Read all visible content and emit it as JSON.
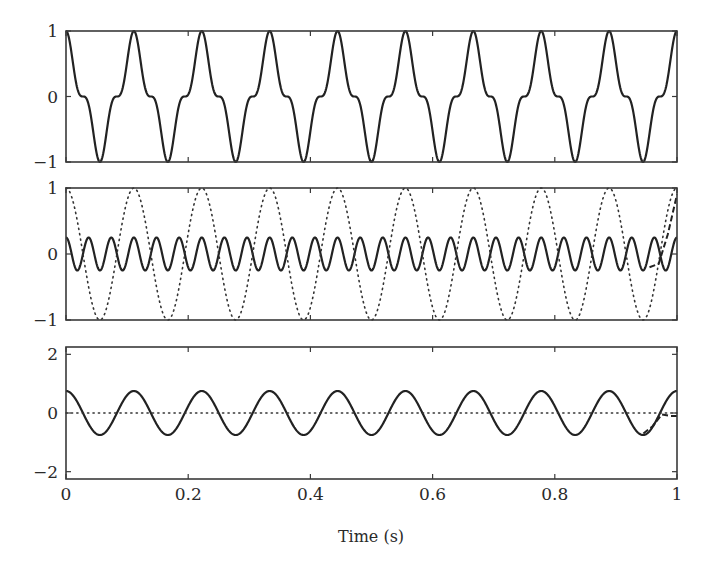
{
  "chart_data": [
    {
      "type": "line",
      "panel": "top",
      "title": "",
      "xlabel": "",
      "ylabel": "",
      "xlim": [
        0,
        1
      ],
      "ylim": [
        -1,
        1
      ],
      "yticks": [
        -1,
        0,
        1
      ],
      "ytick_labels": [
        "−1",
        "0",
        "1"
      ],
      "xticks": [
        0,
        0.2,
        0.4,
        0.6,
        0.8,
        1
      ],
      "grid": false,
      "series": [
        {
          "name": "signal",
          "style": "solid",
          "description": "cos^3(2π·9t) = 0.75cos(2π·9t)+0.25cos(2π·27t)",
          "frequency_hz": 9,
          "amplitude": 1,
          "formula": "cos3"
        }
      ]
    },
    {
      "type": "line",
      "panel": "middle",
      "title": "",
      "xlabel": "",
      "ylabel": "",
      "xlim": [
        0,
        1
      ],
      "ylim": [
        -1,
        1
      ],
      "yticks": [
        -1,
        0,
        1
      ],
      "ytick_labels": [
        "−1",
        "0",
        "1"
      ],
      "xticks": [
        0,
        0.2,
        0.4,
        0.6,
        0.8,
        1
      ],
      "grid": false,
      "series": [
        {
          "name": "third harmonic",
          "style": "solid",
          "frequency_hz": 27,
          "amplitude": 0.25,
          "formula": "cos"
        },
        {
          "name": "reference",
          "style": "dotted",
          "frequency_hz": 9,
          "amplitude": 1,
          "formula": "cos"
        },
        {
          "name": "estimate (edge deviation)",
          "style": "dashed",
          "x": [
            0.955,
            0.97,
            0.985,
            1.0
          ],
          "y": [
            -0.2,
            -0.15,
            0.3,
            0.9
          ]
        }
      ]
    },
    {
      "type": "line",
      "panel": "bottom",
      "title": "",
      "xlabel": "Time (s)",
      "ylabel": "",
      "xlim": [
        0,
        1
      ],
      "ylim": [
        -2.25,
        2.25
      ],
      "yticks": [
        -2,
        0,
        2
      ],
      "ytick_labels": [
        "−2",
        "0",
        "2"
      ],
      "xticks": [
        0,
        0.2,
        0.4,
        0.6,
        0.8,
        1
      ],
      "xtick_labels": [
        "0",
        "0.2",
        "0.4",
        "0.6",
        "0.8",
        "1"
      ],
      "grid": false,
      "series": [
        {
          "name": "fundamental",
          "style": "solid",
          "frequency_hz": 9,
          "amplitude": 0.75,
          "formula": "cos"
        },
        {
          "name": "zero reference",
          "style": "dotted",
          "frequency_hz": 0,
          "amplitude": 0,
          "formula": "const"
        },
        {
          "name": "estimate (edge deviation)",
          "style": "dashed",
          "x": [
            0.945,
            0.96,
            0.975,
            0.99,
            1.0
          ],
          "y": [
            -0.7,
            -0.45,
            -0.05,
            -0.1,
            -0.1
          ]
        }
      ]
    }
  ],
  "axis": {
    "xlabel": "Time (s)",
    "xtick_labels": [
      "0",
      "0.2",
      "0.4",
      "0.6",
      "0.8",
      "1"
    ]
  }
}
